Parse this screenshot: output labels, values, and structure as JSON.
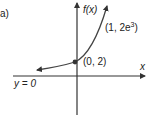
{
  "figure": {
    "part_label": "a)",
    "y_axis_label": "f(x)",
    "x_axis_label": "x",
    "asymptote_label": "y = 0",
    "points": [
      {
        "label": "(0, 2)",
        "x": 0,
        "y": 2
      },
      {
        "label_prefix": "(1, 2e",
        "label_sup": "3",
        "label_suffix": ")",
        "x": 1,
        "y": "2e^3"
      }
    ],
    "colors": {
      "axes": "#333333",
      "curve": "#444444",
      "point": "#333333"
    }
  }
}
